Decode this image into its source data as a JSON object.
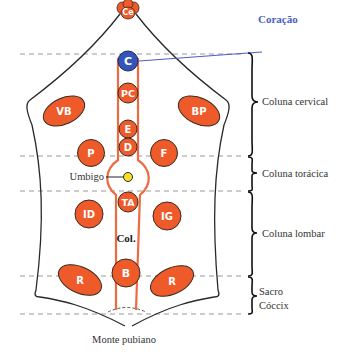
{
  "colors": {
    "node_fill": "#ee5a2a",
    "node_stroke": "#3a2a20",
    "heart_fill": "#3455b8",
    "umbilicus_fill": "#f0e030",
    "channel_stroke": "#ee6a40",
    "outline": "#2a2a2a",
    "dashed": "#999999",
    "heart_label": "#4a5fc4",
    "text": "#333333"
  },
  "nodes": {
    "ce": "Ce",
    "c": "C",
    "pc": "PC",
    "e": "E",
    "d": "D",
    "ta": "TA",
    "b": "B",
    "vb": "VB",
    "bp": "BP",
    "p": "P",
    "f": "F",
    "id": "ID",
    "ig": "IG",
    "r_left": "R",
    "r_right": "R"
  },
  "labels": {
    "heart": "Coração",
    "umbilicus": "Umbigo",
    "spine": "Col.",
    "pubic_mound": "Monte pubiano"
  },
  "regions": [
    {
      "label": "Coluna cervical"
    },
    {
      "label": "Coluna torácica"
    },
    {
      "label": "Coluna lombar"
    },
    {
      "label_line1": "Sacro",
      "label_line2": "Cóccix"
    }
  ]
}
